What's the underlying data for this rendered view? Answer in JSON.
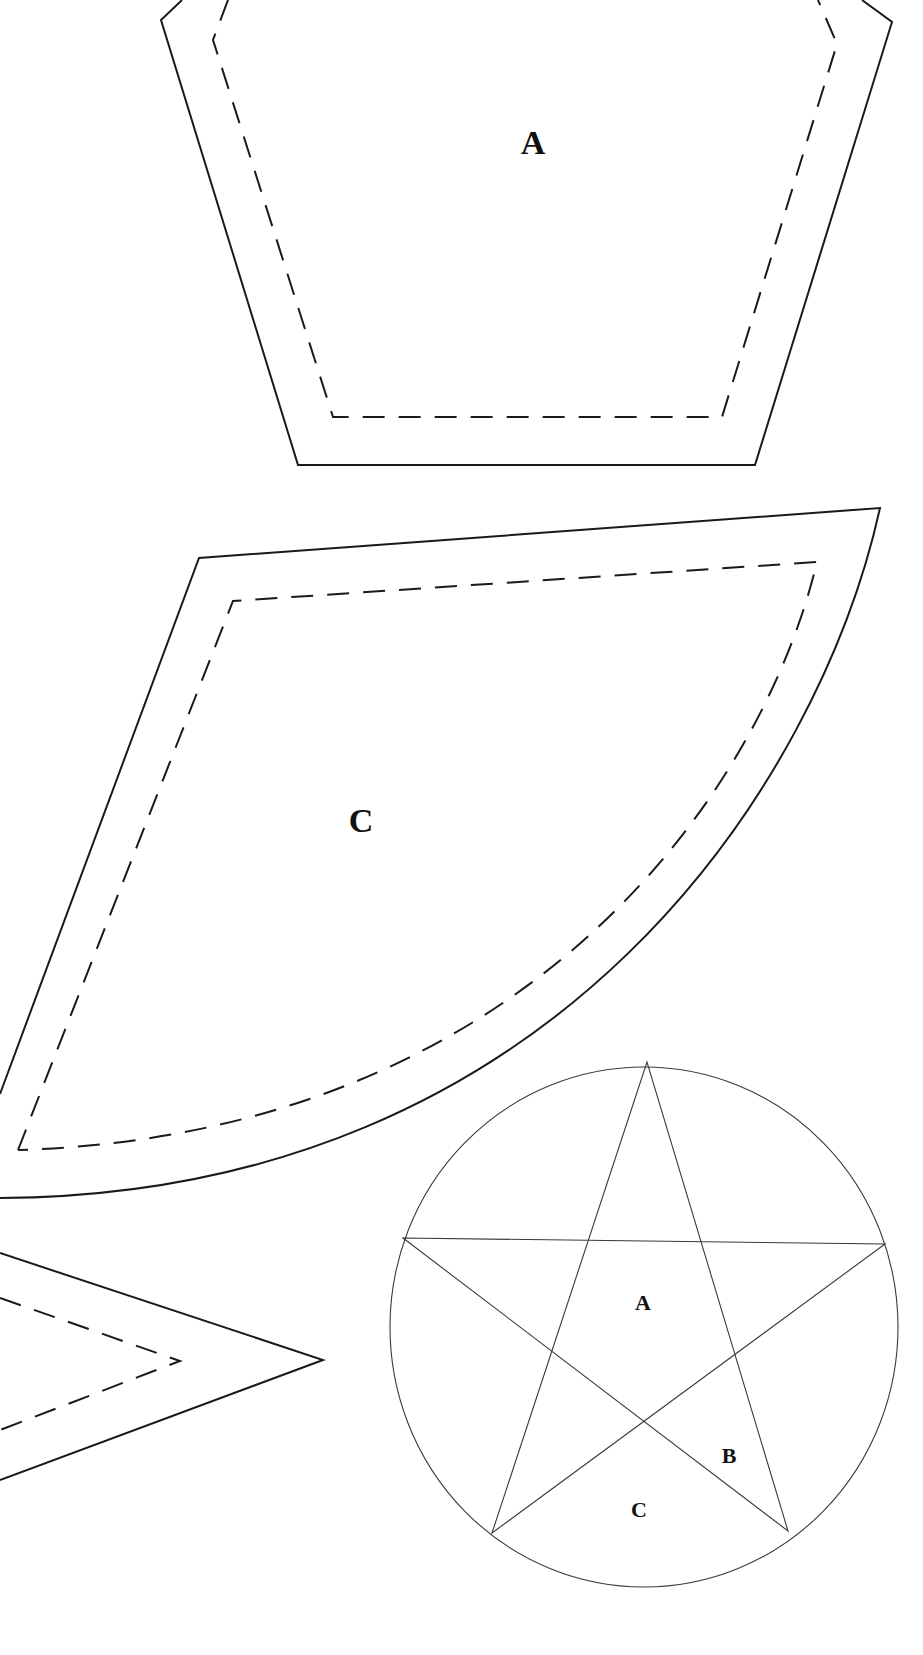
{
  "page": {
    "background": "#ffffff",
    "line_color": "#1a1a1a"
  },
  "pieces": [
    {
      "id": "A",
      "label": "A",
      "shape": "pentagon-template",
      "cut_line": "solid",
      "sewing_line": "dashed"
    },
    {
      "id": "C",
      "label": "C",
      "shape": "curved-wedge-template",
      "cut_line": "solid",
      "sewing_line": "dashed"
    },
    {
      "id": "B",
      "label": "",
      "shape": "star-point-template (partially visible)",
      "cut_line": "solid",
      "sewing_line": "dashed"
    }
  ],
  "key_diagram": {
    "shape": "five-pointed star inscribed in circle",
    "labels": {
      "a": "A",
      "b": "B",
      "c": "C"
    }
  }
}
